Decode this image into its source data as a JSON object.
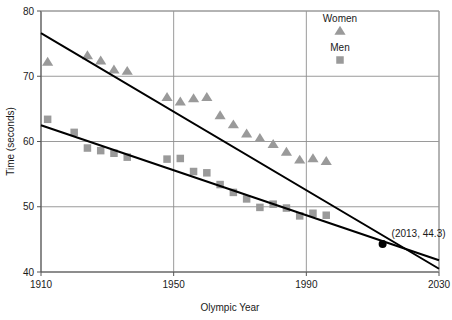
{
  "chart_data": {
    "type": "scatter",
    "title": "",
    "xlabel": "Olympic Year",
    "ylabel": "Time (seconds)",
    "xlim": [
      1910,
      2030
    ],
    "ylim": [
      40,
      80
    ],
    "xticks": [
      1910,
      1950,
      1990,
      2030
    ],
    "xtick_labels": [
      "1910",
      "1950",
      "1990",
      "2030"
    ],
    "yticks": [
      40,
      50,
      60,
      70,
      80
    ],
    "ytick_labels": [
      "40",
      "50",
      "60",
      "70",
      "80"
    ],
    "grid": true,
    "legend_position": "top-right",
    "marker_color": "#9a9a9a",
    "line_color": "#000000",
    "grid_color": "#8f8f8f",
    "series": [
      {
        "name": "Women",
        "marker": "triangle",
        "color": "#9a9a9a",
        "points": [
          [
            1912,
            72.2
          ],
          [
            1924,
            73.2
          ],
          [
            1928,
            72.4
          ],
          [
            1932,
            71.0
          ],
          [
            1936,
            70.8
          ],
          [
            1948,
            66.8
          ],
          [
            1952,
            66.1
          ],
          [
            1956,
            66.6
          ],
          [
            1960,
            66.8
          ],
          [
            1964,
            64.0
          ],
          [
            1968,
            62.6
          ],
          [
            1972,
            61.2
          ],
          [
            1976,
            60.5
          ],
          [
            1980,
            59.6
          ],
          [
            1984,
            58.4
          ],
          [
            1988,
            57.2
          ],
          [
            1992,
            57.4
          ],
          [
            1996,
            57.0
          ]
        ]
      },
      {
        "name": "Men",
        "marker": "square",
        "color": "#9a9a9a",
        "points": [
          [
            1912,
            63.4
          ],
          [
            1920,
            61.4
          ],
          [
            1924,
            59.0
          ],
          [
            1928,
            58.6
          ],
          [
            1932,
            58.2
          ],
          [
            1936,
            57.6
          ],
          [
            1948,
            57.3
          ],
          [
            1952,
            57.4
          ],
          [
            1956,
            55.4
          ],
          [
            1960,
            55.2
          ],
          [
            1964,
            53.4
          ],
          [
            1968,
            52.2
          ],
          [
            1972,
            51.2
          ],
          [
            1976,
            49.9
          ],
          [
            1980,
            50.4
          ],
          [
            1984,
            49.8
          ],
          [
            1988,
            48.6
          ],
          [
            1992,
            49.0
          ],
          [
            1996,
            48.7
          ]
        ]
      }
    ],
    "trendlines": [
      {
        "name": "Women trend",
        "from": [
          1910,
          76.6
        ],
        "to": [
          2030,
          40.5
        ]
      },
      {
        "name": "Men trend",
        "from": [
          1910,
          62.5
        ],
        "to": [
          2030,
          41.8
        ]
      }
    ],
    "annotations": [
      {
        "label": "(2013, 44.3)",
        "x": 2013,
        "y": 44.3,
        "marker": "dot",
        "marker_color": "#000000"
      }
    ]
  },
  "legend": {
    "items": [
      {
        "label": "Women",
        "marker": "triangle"
      },
      {
        "label": "Men",
        "marker": "square"
      }
    ]
  }
}
